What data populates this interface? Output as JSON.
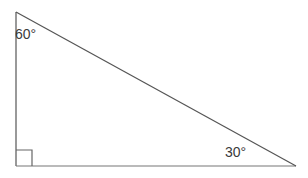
{
  "figure": {
    "kind": "right-triangle-diagram",
    "background_color": "#ffffff",
    "stroke_color": "#555555",
    "text_color": "#3a3a3a",
    "stroke_width": 1,
    "labels": {
      "apex_angle": "60°",
      "base_right_angle": "30°"
    },
    "vertices": {
      "top_left": {
        "x": 16,
        "y": 12
      },
      "bottom_left": {
        "x": 16,
        "y": 166
      },
      "bottom_right": {
        "x": 296,
        "y": 166
      }
    },
    "right_angle_marker": {
      "at_vertex": "bottom_left",
      "x": 16,
      "y": 150,
      "size": 16
    }
  }
}
